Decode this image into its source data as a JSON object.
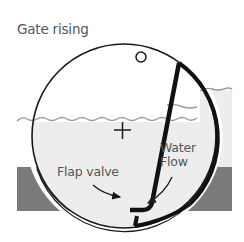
{
  "title": "Gate rising",
  "labels": {
    "flap_valve": "Flap valve",
    "water_flow_line1": "Water",
    "water_flow_line2": "Flow"
  },
  "colors": {
    "water": "#ededed",
    "ground": "#7a7a7a",
    "outline": "#1a1a1a",
    "water_line": "#9a9a9a",
    "text": "#555555"
  }
}
